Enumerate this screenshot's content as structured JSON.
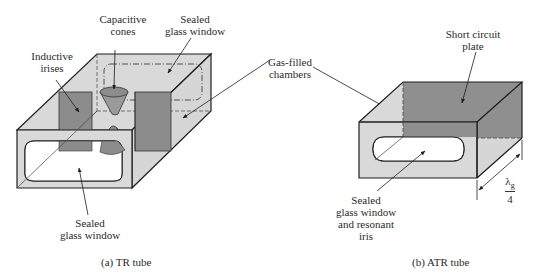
{
  "figure": {
    "panels": [
      {
        "id": "a",
        "caption": "(a)  TR tube",
        "labels": {
          "capacitive_cones": [
            "Capacitive",
            "cones"
          ],
          "sealed_glass_window_top": [
            "Sealed",
            "glass window"
          ],
          "inductive_irises": [
            "Inductive",
            "irises"
          ],
          "sealed_glass_window_bottom": [
            "Sealed",
            "glass window"
          ]
        }
      },
      {
        "id": "b",
        "caption": "(b)  ATR tube",
        "labels": {
          "short_circuit_plate": [
            "Short circuit",
            "plate"
          ],
          "sealed_glass_window_iris": [
            "Sealed",
            "glass window",
            "and resonant",
            "iris"
          ],
          "dimension_numerator": "λ",
          "dimension_subscript": "g",
          "dimension_denominator": "4"
        }
      }
    ],
    "shared_labels": {
      "gas_filled_chambers": [
        "Gas-filled",
        "chambers"
      ]
    },
    "colors": {
      "glass_fill": "#d9d9d9",
      "iris_fill": "#8c8c8c",
      "plate_fill": "#8f8f8f",
      "outline": "#1e1e1e",
      "window_fill": "#ffffff"
    }
  }
}
